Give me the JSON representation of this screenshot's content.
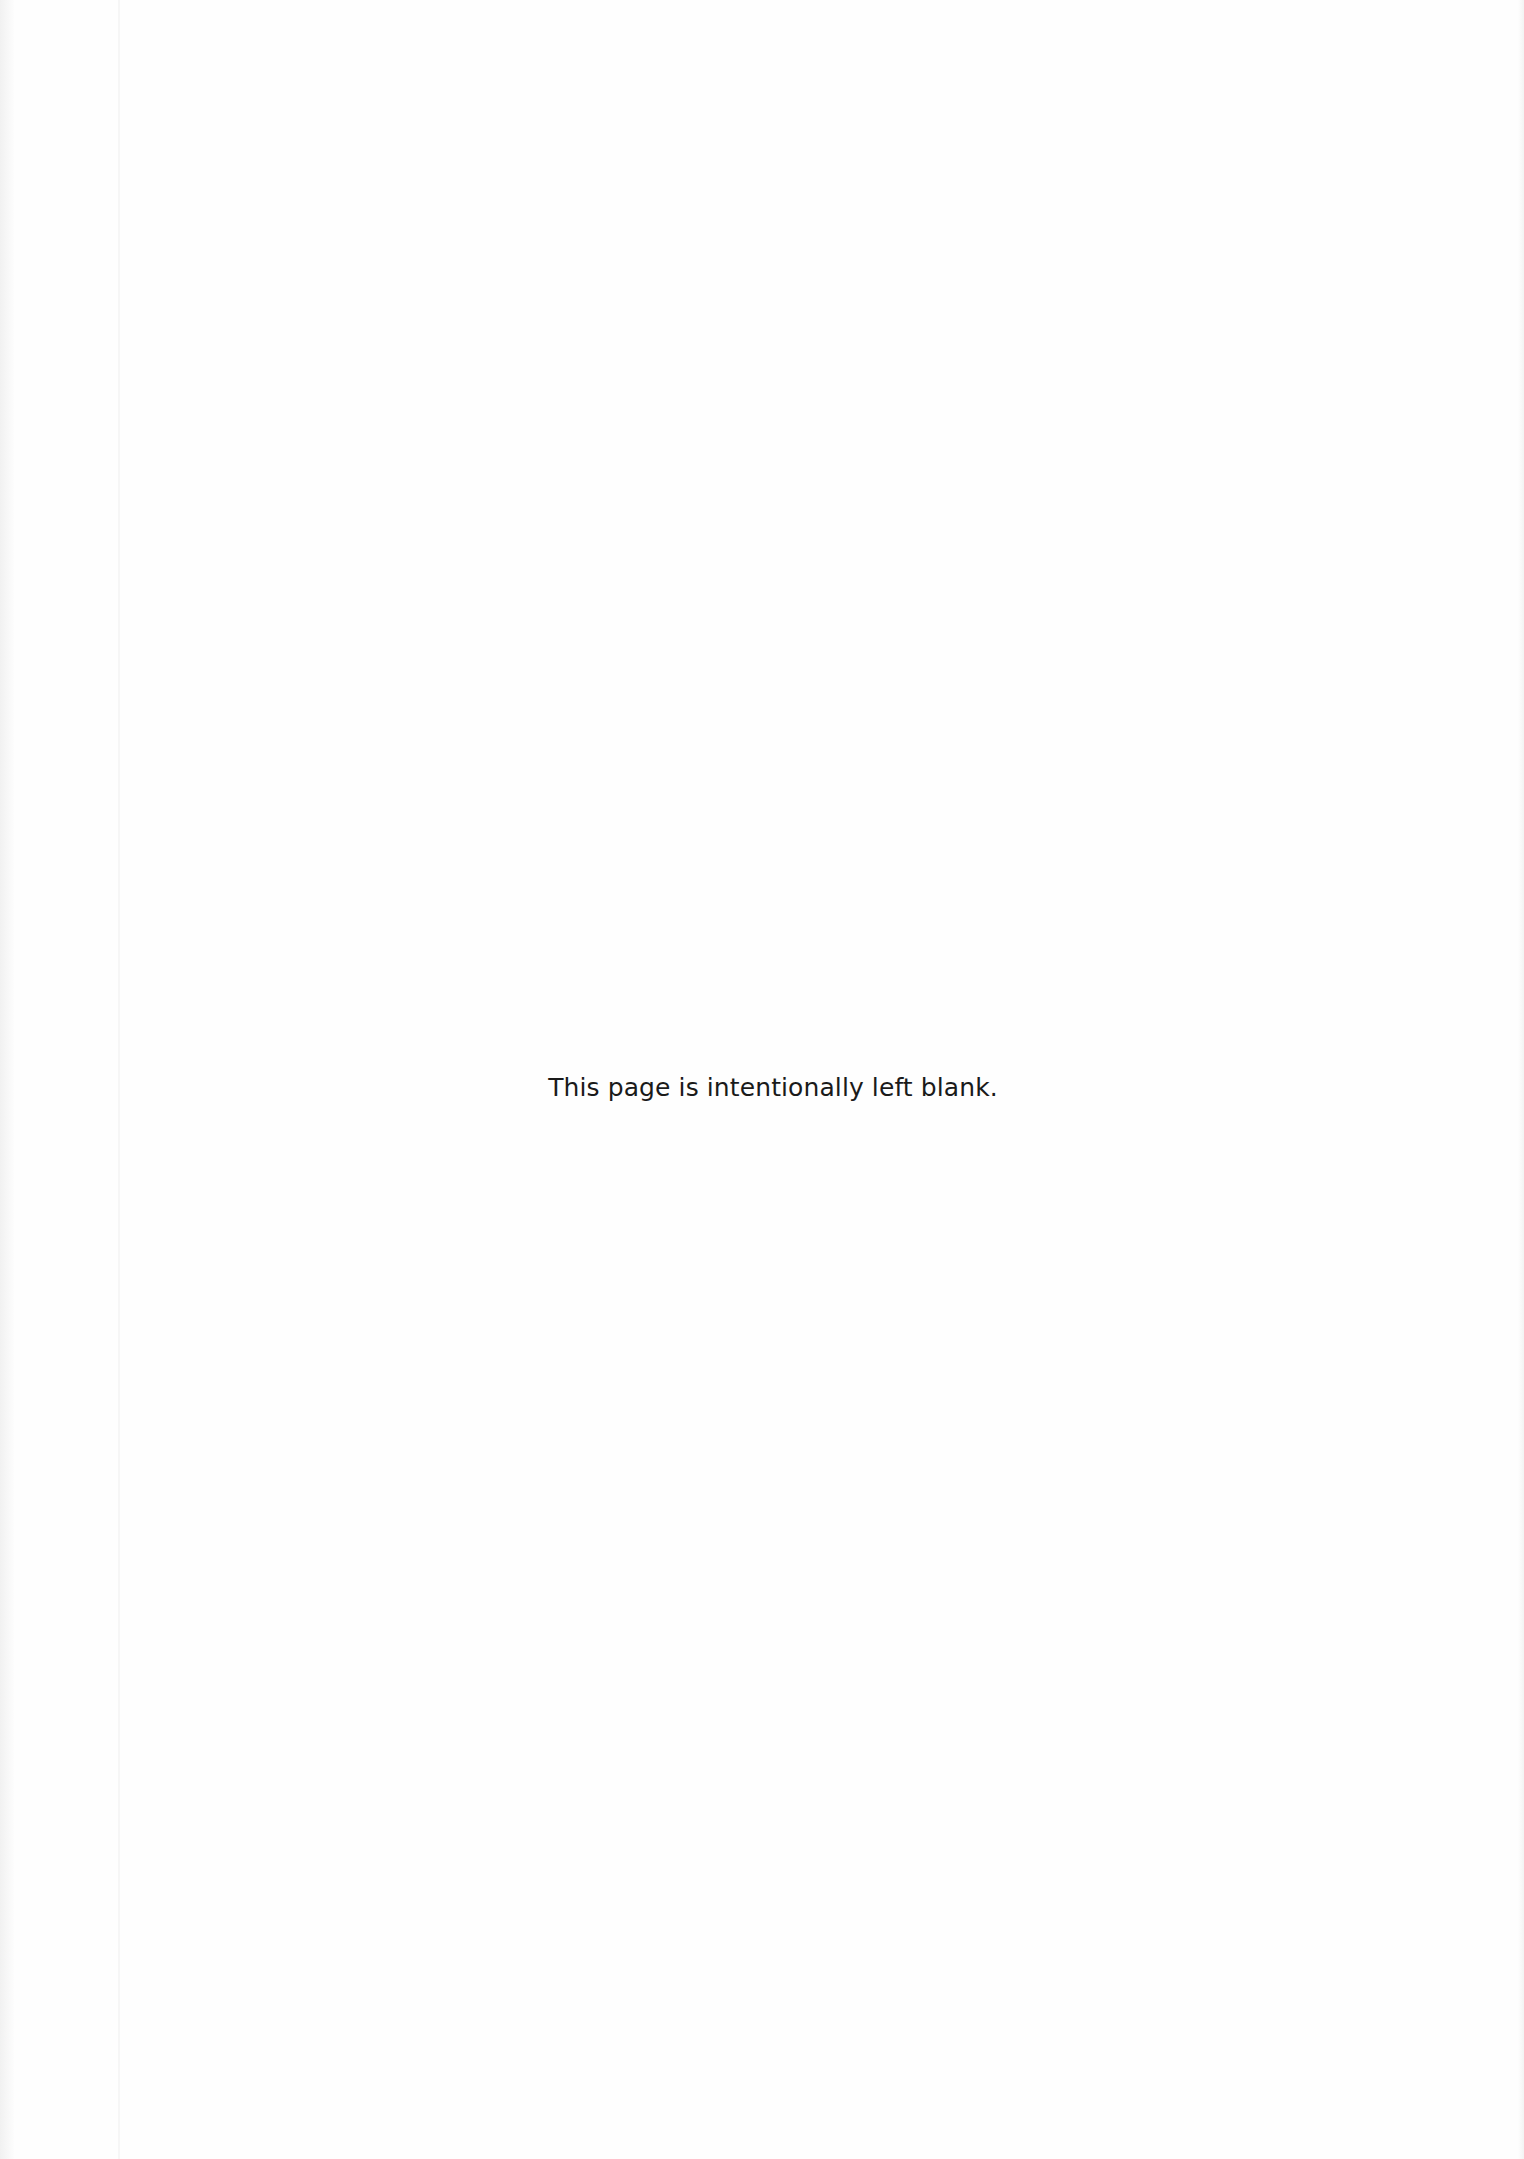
{
  "page": {
    "notice": "This page is intentionally left blank."
  }
}
